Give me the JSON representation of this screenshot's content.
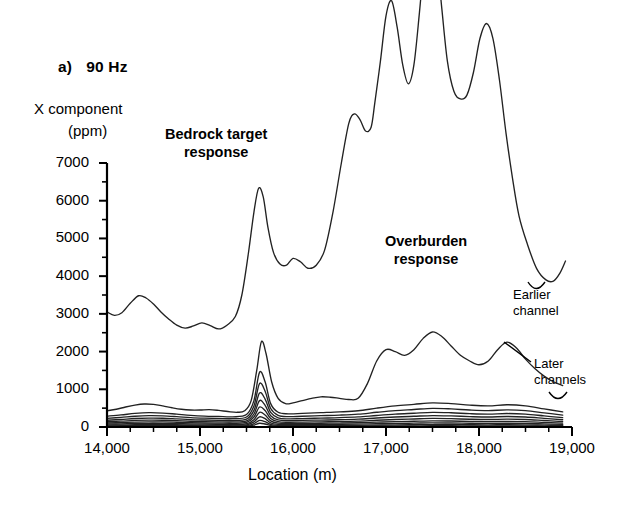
{
  "panel": {
    "tag": "a)",
    "frequency": "90 Hz"
  },
  "labels": {
    "y_axis_line1": "X component",
    "y_axis_line2": "(ppm)",
    "x_axis_title": "Location (m)",
    "annotation_bedrock_line1": "Bedrock target",
    "annotation_bedrock_line2": "response",
    "annotation_overburden_line1": "Overburden",
    "annotation_overburden_line2": "response",
    "annotation_earlier_line1": "Earlier",
    "annotation_earlier_line2": "channel",
    "annotation_later_line1": "Later",
    "annotation_later_line2": "channels"
  },
  "colors": {
    "axis": "#000000",
    "curve": "#222222",
    "background": "#ffffff"
  },
  "chart_data": {
    "type": "line",
    "xlabel": "Location (m)",
    "ylabel": "X component (ppm)",
    "xlim": [
      14000,
      19000
    ],
    "ylim": [
      0,
      7000
    ],
    "xticks": [
      14000,
      15000,
      16000,
      17000,
      18000,
      19000
    ],
    "xticklabels": [
      "14,000",
      "15,000",
      "16,000",
      "17,000",
      "18,000",
      "19,000"
    ],
    "xminor_step": 250,
    "yticks": [
      0,
      1000,
      2000,
      3000,
      4000,
      5000,
      6000,
      7000
    ],
    "yticklabels": [
      "0",
      "1000",
      "2000",
      "3000",
      "4000",
      "5000",
      "6000",
      "7000"
    ],
    "yminor_step": 500,
    "grid": false,
    "legend": "none",
    "annotations": [
      {
        "text": "Bedrock target response",
        "x": 15450,
        "y": 7900
      },
      {
        "text": "Overburden response",
        "x": 17450,
        "y": 4900
      },
      {
        "text": "Earlier channel",
        "x": 18900,
        "y": 3550
      },
      {
        "text": "Later channels",
        "x": 19050,
        "y": 1700
      }
    ],
    "series": [
      {
        "name": "Earlier channel",
        "label": "Earlier channel",
        "x": [
          14000,
          14080,
          14160,
          14250,
          14340,
          14420,
          14500,
          14580,
          14660,
          14750,
          14840,
          14930,
          15020,
          15110,
          15200,
          15290,
          15380,
          15450,
          15520,
          15580,
          15630,
          15680,
          15730,
          15790,
          15860,
          15930,
          16000,
          16080,
          16160,
          16250,
          16340,
          16430,
          16520,
          16600,
          16660,
          16720,
          16780,
          16840,
          16880,
          16940,
          17000,
          17060,
          17120,
          17180,
          17240,
          17300,
          17360,
          17420,
          17480,
          17540,
          17600,
          17660,
          17730,
          17800,
          17870,
          17940,
          18010,
          18080,
          18150,
          18220,
          18290,
          18360,
          18430,
          18520,
          18620,
          18720,
          18800,
          18870,
          18930
        ],
        "y": [
          3050,
          2960,
          3030,
          3280,
          3480,
          3420,
          3260,
          3050,
          2870,
          2700,
          2620,
          2680,
          2760,
          2690,
          2600,
          2700,
          2930,
          3500,
          4600,
          5700,
          6330,
          6100,
          5300,
          4630,
          4320,
          4290,
          4470,
          4380,
          4210,
          4290,
          4690,
          5700,
          7000,
          8050,
          8300,
          8150,
          7850,
          7950,
          8600,
          9700,
          10900,
          11300,
          10600,
          9600,
          9100,
          9600,
          11000,
          12600,
          13300,
          12600,
          11100,
          9700,
          8900,
          8700,
          8800,
          9400,
          10300,
          10700,
          10300,
          9200,
          7800,
          6600,
          5600,
          4850,
          4200,
          3900,
          3870,
          4080,
          4400
        ]
      },
      {
        "name": "Later channel 1",
        "label": "Later channels",
        "x": [
          14000,
          14100,
          14200,
          14300,
          14400,
          14500,
          14600,
          14700,
          14800,
          14900,
          15000,
          15100,
          15200,
          15300,
          15400,
          15480,
          15550,
          15610,
          15660,
          15710,
          15770,
          15840,
          15920,
          16000,
          16100,
          16200,
          16300,
          16400,
          16500,
          16600,
          16700,
          16800,
          16900,
          17000,
          17100,
          17200,
          17300,
          17400,
          17500,
          17600,
          17700,
          17800,
          17900,
          18000,
          18100,
          18200,
          18300,
          18400,
          18500,
          18600,
          18700,
          18800,
          18900
        ],
        "y": [
          430,
          470,
          530,
          580,
          610,
          600,
          560,
          510,
          470,
          450,
          450,
          460,
          440,
          410,
          390,
          430,
          700,
          1500,
          2260,
          1950,
          1200,
          760,
          620,
          640,
          700,
          760,
          800,
          790,
          760,
          730,
          760,
          1150,
          1750,
          2050,
          2000,
          1900,
          2050,
          2350,
          2520,
          2400,
          2150,
          1900,
          1750,
          1650,
          1750,
          2050,
          2250,
          2100,
          1800,
          1550,
          1350,
          1200,
          1100
        ]
      },
      {
        "name": "Later channel 2",
        "x": [
          14000,
          14150,
          14300,
          14450,
          14600,
          14750,
          14900,
          15050,
          15200,
          15350,
          15500,
          15580,
          15640,
          15700,
          15760,
          15840,
          15950,
          16100,
          16300,
          16500,
          16700,
          16900,
          17100,
          17300,
          17500,
          17700,
          17900,
          18100,
          18300,
          18500,
          18700,
          18900
        ],
        "y": [
          290,
          320,
          360,
          380,
          370,
          340,
          310,
          290,
          280,
          270,
          330,
          700,
          1450,
          1200,
          620,
          390,
          350,
          360,
          380,
          400,
          430,
          500,
          560,
          600,
          640,
          620,
          580,
          560,
          590,
          560,
          480,
          400
        ]
      },
      {
        "name": "Later channel 3",
        "x": [
          14000,
          14150,
          14300,
          14450,
          14600,
          14750,
          14900,
          15050,
          15200,
          15350,
          15500,
          15580,
          15640,
          15700,
          15760,
          15840,
          15950,
          16100,
          16300,
          16500,
          16700,
          16900,
          17100,
          17300,
          17500,
          17700,
          17900,
          18100,
          18300,
          18500,
          18700,
          18900
        ],
        "y": [
          230,
          255,
          285,
          300,
          295,
          275,
          250,
          235,
          225,
          220,
          265,
          560,
          1150,
          950,
          490,
          310,
          275,
          285,
          300,
          315,
          340,
          390,
          435,
          465,
          495,
          480,
          450,
          435,
          455,
          435,
          375,
          315
        ]
      },
      {
        "name": "Later channel 4",
        "x": [
          14000,
          14150,
          14300,
          14450,
          14600,
          14750,
          14900,
          15050,
          15200,
          15350,
          15500,
          15580,
          15640,
          15700,
          15760,
          15840,
          15950,
          16100,
          16300,
          16500,
          16700,
          16900,
          17100,
          17300,
          17500,
          17700,
          17900,
          18100,
          18300,
          18500,
          18700,
          18900
        ],
        "y": [
          180,
          200,
          225,
          235,
          232,
          215,
          196,
          185,
          177,
          173,
          208,
          440,
          900,
          740,
          385,
          243,
          216,
          224,
          236,
          247,
          267,
          306,
          341,
          365,
          388,
          377,
          353,
          341,
          357,
          341,
          294,
          247
        ]
      },
      {
        "name": "Later channel 5",
        "x": [
          14000,
          14150,
          14300,
          14450,
          14600,
          14750,
          14900,
          15050,
          15200,
          15350,
          15500,
          15580,
          15640,
          15700,
          15760,
          15840,
          15950,
          16100,
          16300,
          16500,
          16700,
          16900,
          17100,
          17300,
          17500,
          17700,
          17900,
          18100,
          18300,
          18500,
          18700,
          18900
        ],
        "y": [
          140,
          155,
          175,
          183,
          180,
          167,
          152,
          143,
          137,
          134,
          161,
          345,
          700,
          575,
          300,
          189,
          168,
          174,
          184,
          192,
          208,
          238,
          265,
          284,
          302,
          293,
          275,
          265,
          278,
          265,
          229,
          192
        ]
      },
      {
        "name": "Later channel 6",
        "x": [
          14000,
          14150,
          14300,
          14450,
          14600,
          14750,
          14900,
          15050,
          15200,
          15350,
          15500,
          15580,
          15640,
          15700,
          15760,
          15840,
          15950,
          16100,
          16300,
          16500,
          16700,
          16900,
          17100,
          17300,
          17500,
          17700,
          17900,
          18100,
          18300,
          18500,
          18700,
          18900
        ],
        "y": [
          105,
          116,
          131,
          137,
          135,
          125,
          114,
          107,
          103,
          100,
          121,
          265,
          530,
          435,
          226,
          142,
          126,
          130,
          138,
          144,
          156,
          179,
          199,
          213,
          227,
          220,
          206,
          199,
          208,
          199,
          172,
          144
        ]
      },
      {
        "name": "Later channel 7",
        "x": [
          14000,
          14150,
          14300,
          14450,
          14600,
          14750,
          14900,
          15050,
          15200,
          15350,
          15500,
          15580,
          15640,
          15700,
          15760,
          15840,
          15950,
          16100,
          16300,
          16500,
          16700,
          16900,
          17100,
          17300,
          17500,
          17700,
          17900,
          18100,
          18300,
          18500,
          18700,
          18900
        ],
        "y": [
          75,
          83,
          94,
          98,
          97,
          90,
          82,
          77,
          74,
          72,
          87,
          195,
          390,
          320,
          163,
          102,
          91,
          94,
          99,
          104,
          112,
          128,
          143,
          153,
          163,
          158,
          148,
          143,
          150,
          143,
          124,
          104
        ]
      },
      {
        "name": "Later channel 8",
        "x": [
          14000,
          14150,
          14300,
          14450,
          14600,
          14750,
          14900,
          15050,
          15200,
          15350,
          15500,
          15580,
          15640,
          15700,
          15760,
          15840,
          15950,
          16100,
          16300,
          16500,
          16700,
          16900,
          17100,
          17300,
          17500,
          17700,
          17900,
          18100,
          18300,
          18500,
          18700,
          18900
        ],
        "y": [
          50,
          55,
          62,
          65,
          64,
          60,
          54,
          51,
          49,
          48,
          58,
          135,
          270,
          220,
          110,
          68,
          60,
          63,
          66,
          69,
          75,
          86,
          95,
          102,
          109,
          105,
          99,
          95,
          100,
          95,
          82,
          69
        ]
      },
      {
        "name": "Later channel 9",
        "x": [
          14000,
          14150,
          14300,
          14450,
          14600,
          14750,
          14900,
          15050,
          15200,
          15350,
          15500,
          15580,
          15640,
          15700,
          15760,
          15840,
          15950,
          16100,
          16300,
          16500,
          16700,
          16900,
          17100,
          17300,
          17500,
          17700,
          17900,
          18100,
          18300,
          18500,
          18700,
          18900
        ],
        "y": [
          30,
          33,
          37,
          39,
          38,
          36,
          32,
          30,
          29,
          29,
          35,
          88,
          175,
          142,
          70,
          41,
          36,
          38,
          40,
          42,
          45,
          51,
          57,
          61,
          65,
          63,
          59,
          57,
          60,
          57,
          49,
          41
        ]
      },
      {
        "name": "Later channel 10",
        "x": [
          14000,
          14150,
          14300,
          14450,
          14600,
          14750,
          14900,
          15050,
          15200,
          15350,
          15500,
          15580,
          15640,
          15700,
          15760,
          15840,
          15950,
          16100,
          16300,
          16500,
          16700,
          16900,
          17100,
          17300,
          17500,
          17700,
          17900,
          18100,
          18300,
          18500,
          18700,
          18900
        ],
        "y": [
          15,
          17,
          19,
          20,
          19,
          18,
          16,
          15,
          15,
          14,
          18,
          50,
          100,
          80,
          38,
          21,
          18,
          19,
          20,
          21,
          23,
          26,
          29,
          31,
          33,
          32,
          30,
          29,
          30,
          29,
          25,
          21
        ]
      }
    ]
  }
}
